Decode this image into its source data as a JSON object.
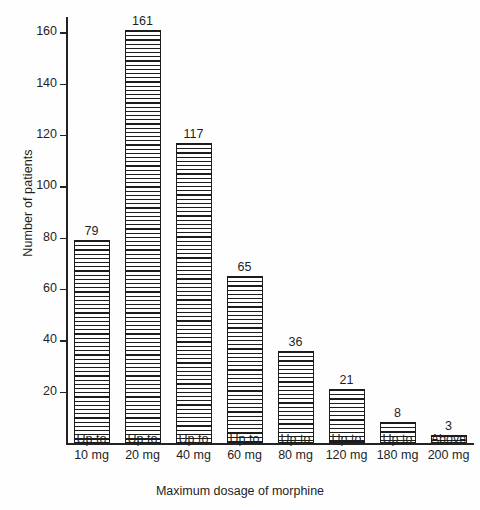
{
  "chart_data": {
    "type": "bar",
    "title": "",
    "xlabel": "Maximum dosage of morphine",
    "ylabel": "Number of patients",
    "categories": [
      "Up to 10 mg",
      "Up to 20 mg",
      "Up to 40 mg",
      "Up to 60 mg",
      "Up to 80 mg",
      "Up to 120 mg",
      "Up to 180 mg",
      "Above 200 mg"
    ],
    "category_lines": [
      [
        "Up to",
        "10 mg"
      ],
      [
        "Up to",
        "20 mg"
      ],
      [
        "Up to",
        "40 mg"
      ],
      [
        "Up to",
        "60 mg"
      ],
      [
        "Up to",
        "80 mg"
      ],
      [
        "Up to",
        "120 mg"
      ],
      [
        "Up to",
        "180 mg"
      ],
      [
        "Above",
        "200 mg"
      ]
    ],
    "values": [
      79,
      161,
      117,
      65,
      36,
      21,
      8,
      3
    ],
    "value_labels": [
      "79",
      "161",
      "117",
      "65",
      "36",
      "21",
      "8",
      "3"
    ],
    "ylim": [
      0,
      166
    ],
    "yticks": [
      20,
      40,
      60,
      80,
      100,
      120,
      140,
      160
    ],
    "ytick_labels": [
      "20",
      "40",
      "60",
      "80",
      "100",
      "120",
      "140",
      "160"
    ],
    "grid": false,
    "legend": null,
    "bar_style": {
      "fill": "horizontal-hatch",
      "edge_color": "#1c1c1c",
      "face_color": "#ffffff"
    }
  },
  "axis": {
    "y_title": "Number of patients",
    "x_title": "Maximum dosage of morphine"
  }
}
